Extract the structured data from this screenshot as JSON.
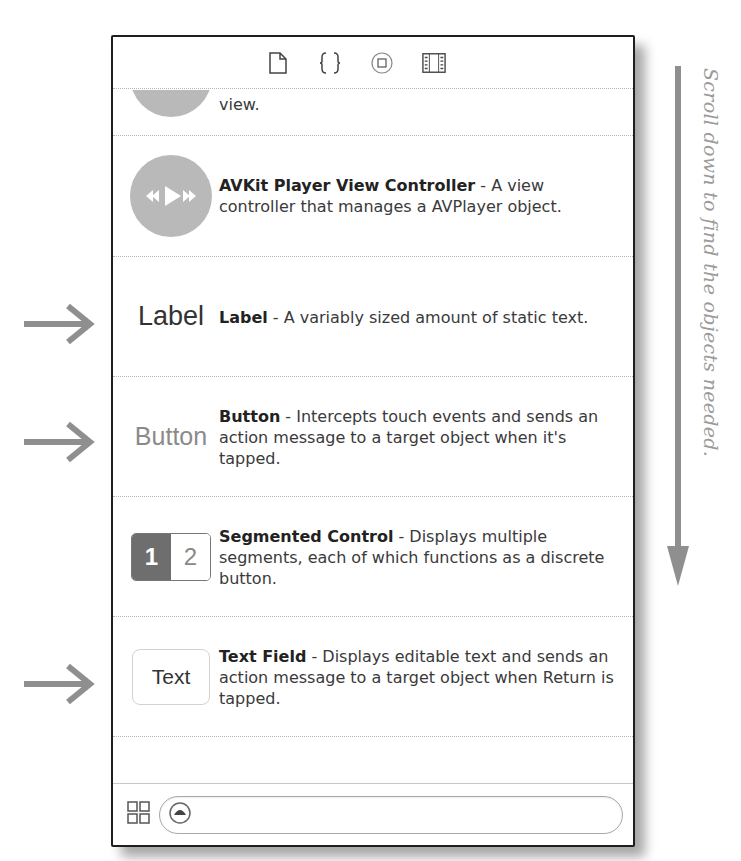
{
  "toolbar": {
    "icons": [
      "file-template-icon",
      "code-snippet-icon",
      "object-library-icon",
      "media-library-icon"
    ]
  },
  "library": {
    "items": [
      {
        "thumb": "partial-view-icon",
        "title": "",
        "description": "view."
      },
      {
        "thumb": "avkit-player-icon",
        "title": "AVKit Player View Controller",
        "description": " - A view controller that manages a AVPlayer object."
      },
      {
        "thumb_text": "Label",
        "title": "Label",
        "description": " - A variably sized amount of static text."
      },
      {
        "thumb_text": "Button",
        "title": "Button",
        "description": " - Intercepts touch events and sends an action message to a target object when it's tapped."
      },
      {
        "thumb_seg": [
          "1",
          "2"
        ],
        "title": "Segmented Control",
        "description": " - Displays multiple segments, each of which functions as a discrete button."
      },
      {
        "thumb_text": "Text",
        "title": "Text Field",
        "description": " - Displays editable text and sends an action message to a target object when Return is tapped."
      },
      {
        "thumb": "slider-icon",
        "title": "Slider",
        "description": " - Displays a continuous range"
      }
    ]
  },
  "footer": {
    "grid_toggle": "grid-view-icon",
    "filter_value": "",
    "filter_placeholder": ""
  },
  "annotations": {
    "scroll_note": "Scroll down to find the objects needed.",
    "arrow_targets": [
      "Label",
      "Button",
      "Text Field"
    ]
  },
  "colors": {
    "panel_border": "#1e1e1e",
    "annotation_gray": "#9a9a9a",
    "thumb_gray": "#b9b9b9"
  }
}
